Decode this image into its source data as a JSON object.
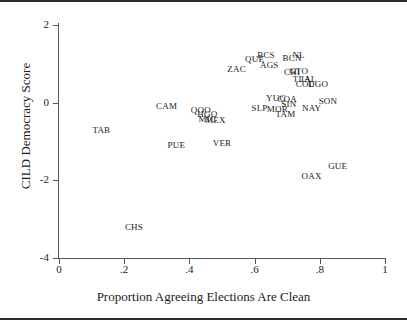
{
  "chart_data": {
    "type": "scatter",
    "title": "",
    "xlabel": "Proportion Agreeing Elections Are Clean",
    "ylabel": "CILD Democracy Score",
    "xlim": [
      0,
      1
    ],
    "ylim": [
      -4,
      2
    ],
    "xticks": [
      "0",
      ".2",
      ".4",
      ".6",
      ".8",
      "1"
    ],
    "xtickvals": [
      0,
      0.2,
      0.4,
      0.6,
      0.8,
      1
    ],
    "yticks": [
      "2",
      "0",
      "-2",
      "-4"
    ],
    "ytickvals": [
      2,
      0,
      -2,
      -4
    ],
    "grid": false,
    "legend": "none",
    "marker_style": "text-label",
    "points": [
      {
        "label": "TAB",
        "x": 0.13,
        "y": -0.7
      },
      {
        "label": "CHS",
        "x": 0.23,
        "y": -3.2
      },
      {
        "label": "CAM",
        "x": 0.33,
        "y": -0.08
      },
      {
        "label": "PUE",
        "x": 0.36,
        "y": -1.1
      },
      {
        "label": "QOO",
        "x": 0.435,
        "y": -0.18
      },
      {
        "label": "HGO",
        "x": 0.455,
        "y": -0.3
      },
      {
        "label": "MIC",
        "x": 0.455,
        "y": -0.42
      },
      {
        "label": "MEX",
        "x": 0.48,
        "y": -0.44
      },
      {
        "label": "VER",
        "x": 0.5,
        "y": -1.04
      },
      {
        "label": "ZAC",
        "x": 0.545,
        "y": 0.86
      },
      {
        "label": "QUE",
        "x": 0.6,
        "y": 1.12
      },
      {
        "label": "BCS",
        "x": 0.635,
        "y": 1.22
      },
      {
        "label": "AGS",
        "x": 0.645,
        "y": 0.98
      },
      {
        "label": "SLP",
        "x": 0.615,
        "y": -0.14
      },
      {
        "label": "MOR",
        "x": 0.67,
        "y": -0.16
      },
      {
        "label": "YUC",
        "x": 0.665,
        "y": 0.12
      },
      {
        "label": "COA",
        "x": 0.7,
        "y": 0.1
      },
      {
        "label": "SIN",
        "x": 0.705,
        "y": -0.04
      },
      {
        "label": "TAM",
        "x": 0.695,
        "y": -0.3
      },
      {
        "label": "BCN",
        "x": 0.715,
        "y": 1.14
      },
      {
        "label": "NL",
        "x": 0.735,
        "y": 1.24
      },
      {
        "label": "CHI",
        "x": 0.715,
        "y": 0.78
      },
      {
        "label": "GTO",
        "x": 0.735,
        "y": 0.82
      },
      {
        "label": "TLA",
        "x": 0.745,
        "y": 0.62
      },
      {
        "label": "JAL",
        "x": 0.765,
        "y": 0.62
      },
      {
        "label": "COL",
        "x": 0.755,
        "y": 0.48
      },
      {
        "label": "DGO",
        "x": 0.795,
        "y": 0.48
      },
      {
        "label": "NAY",
        "x": 0.775,
        "y": -0.14
      },
      {
        "label": "SON",
        "x": 0.825,
        "y": 0.04
      },
      {
        "label": "OAX",
        "x": 0.775,
        "y": -1.88
      },
      {
        "label": "GUE",
        "x": 0.855,
        "y": -1.62
      }
    ]
  }
}
